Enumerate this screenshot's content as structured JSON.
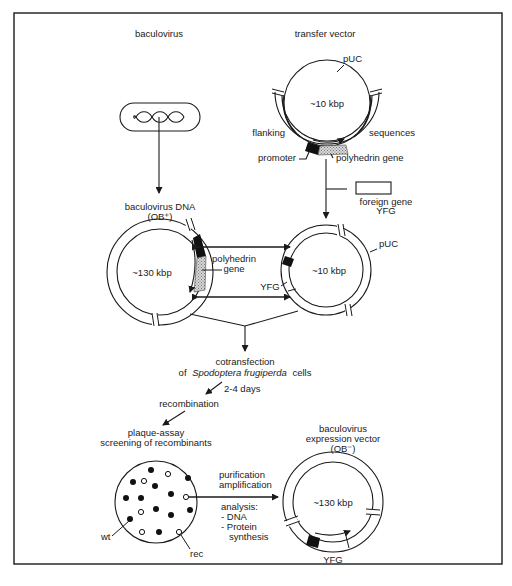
{
  "figure": {
    "columns": {
      "left_title": "baculovirus",
      "right_title": "transfer vector"
    },
    "transfer_vector": {
      "backbone": "pUC",
      "size": "~10 kbp",
      "flanking_left": "flanking",
      "flanking_right": "sequences",
      "promoter": "promoter",
      "gene": "polyhedrin gene"
    },
    "foreign_gene": {
      "line1": "foreign gene",
      "line2": "YFG"
    },
    "baculovirus_dna": {
      "line1": "baculovirus DNA",
      "line2": "(OB⁺)",
      "size": "~130 kbp"
    },
    "recombination_labels": {
      "gene_line1": "polyhedrin",
      "gene_line2": "gene",
      "yfg": "YFG"
    },
    "recombinant_vector": {
      "backbone": "pUC",
      "size": "~10 kbp"
    },
    "steps": {
      "cotransfection_line1": "cotransfection",
      "cotransfection_line2_prefix": "of",
      "cotransfection_species": "Spodoptera frugiperda",
      "cotransfection_line2_suffix": "cells",
      "duration": "2-4 days",
      "recombination": "recombination",
      "plaque_line1": "plaque-assay",
      "plaque_line2": "screening of recombinants"
    },
    "plaque_plate": {
      "wt_label": "wt",
      "rec_label": "rec"
    },
    "purification": {
      "line1": "purification",
      "line2": "amplification",
      "analysis_title": "analysis:",
      "analysis_items": [
        "- DNA",
        "- Protein",
        "  synthesis"
      ]
    },
    "expression_vector": {
      "line1": "baculovirus",
      "line2": "expression vector",
      "line3": "(OB⁻)",
      "size": "~130 kbp",
      "gene": "YFG"
    }
  }
}
